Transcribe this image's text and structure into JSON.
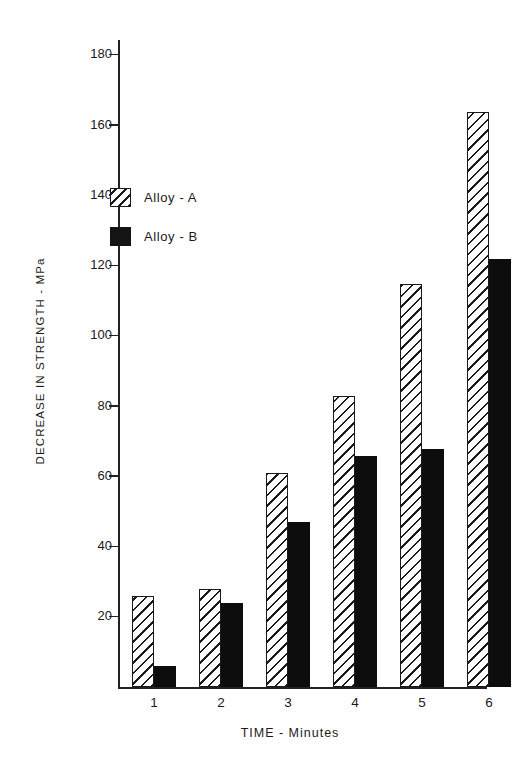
{
  "chart_data": {
    "type": "bar",
    "title": "",
    "xlabel": "TIME - Minutes",
    "ylabel": "DECREASE IN STRENGTH - MPa",
    "categories": [
      "1",
      "2",
      "3",
      "4",
      "5",
      "6"
    ],
    "series": [
      {
        "name": "Alloy - A",
        "values": [
          26,
          28,
          61,
          83,
          115,
          164
        ],
        "fill": "hatched",
        "color": "#1a1a1a"
      },
      {
        "name": "Alloy - B",
        "values": [
          6,
          24,
          47,
          66,
          68,
          122
        ],
        "fill": "solid",
        "color": "#0d0d0d"
      }
    ],
    "ylim": [
      0,
      180
    ],
    "yticks": [
      20,
      40,
      60,
      80,
      100,
      120,
      140,
      160,
      180
    ],
    "ytick_labels": [
      "20",
      "40",
      "60",
      "80",
      "100",
      "120",
      "140",
      "160",
      "180"
    ],
    "xticks": [
      "1",
      "2",
      "3",
      "4",
      "5",
      "6"
    ],
    "grid": false,
    "legend_position": "upper-left-inside",
    "legend": [
      "Alloy - A",
      "Alloy - B"
    ],
    "background": "#ffffff",
    "axis_color": "#222222"
  }
}
